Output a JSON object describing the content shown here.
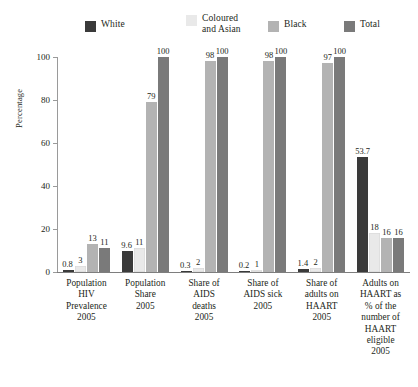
{
  "chart_data": {
    "type": "bar",
    "title": "",
    "subtitle": "",
    "xlabel": "",
    "ylabel": "Percentage",
    "ylim": [
      0,
      100
    ],
    "yticks": [
      0,
      20,
      40,
      60,
      80,
      100
    ],
    "grid": false,
    "legend_position": "top",
    "categories": [
      "Population HIV Prevalence 2005",
      "Population Share 2005",
      "Share of AIDS deaths 2005",
      "Share of AIDS sick 2005",
      "Share of adults on HAART 2005",
      "Adults on HAART as % of the number of HAART eligible 2005"
    ],
    "category_lines": [
      [
        "Population",
        "HIV",
        "Prevalence",
        "2005"
      ],
      [
        "Population",
        "Share",
        "2005"
      ],
      [
        "Share of",
        "AIDS",
        "deaths",
        "2005"
      ],
      [
        "Share of",
        "AIDS sick",
        "2005"
      ],
      [
        "Share of",
        "adults on",
        "HAART",
        "2005"
      ],
      [
        "Adults on",
        "HAART as",
        "% of the",
        "number of",
        "HAART",
        "eligible",
        "2005"
      ]
    ],
    "series": [
      {
        "name": "White",
        "color": "#3a3a3a",
        "values": [
          0.8,
          9.6,
          0.3,
          0.2,
          1.4,
          53.7
        ],
        "labels": [
          "0.8",
          "9.6",
          "0.3",
          "0.2",
          "1.4",
          "53.7"
        ]
      },
      {
        "name": "Coloured and Asian",
        "color": "#e9e9e9",
        "values": [
          3,
          11,
          2,
          1,
          2,
          18
        ],
        "labels": [
          "3",
          "11",
          "2",
          "1",
          "2",
          "18"
        ]
      },
      {
        "name": "Black",
        "color": "#b3b3b3",
        "values": [
          13,
          79,
          98,
          98,
          97,
          16
        ],
        "labels": [
          "13",
          "79",
          "98",
          "98",
          "97",
          "16"
        ]
      },
      {
        "name": "Total",
        "color": "#7a7a7a",
        "values": [
          11,
          100,
          100,
          100,
          100,
          16
        ],
        "labels": [
          "11",
          "100",
          "100",
          "100",
          "100",
          "16"
        ]
      }
    ]
  },
  "legend": {
    "items": [
      {
        "label": "White",
        "line1": "White",
        "line2": "",
        "color": "#3a3a3a"
      },
      {
        "label": "Coloured and Asian",
        "line1": "Coloured",
        "line2": "and Asian",
        "color": "#e9e9e9"
      },
      {
        "label": "Black",
        "line1": "Black",
        "line2": "",
        "color": "#b3b3b3"
      },
      {
        "label": "Total",
        "line1": "Total",
        "line2": "",
        "color": "#7a7a7a"
      }
    ]
  },
  "axis": {
    "y_title": "Percentage",
    "y_tick_labels": [
      "100",
      "80",
      "60",
      "40",
      "20",
      "0"
    ]
  }
}
